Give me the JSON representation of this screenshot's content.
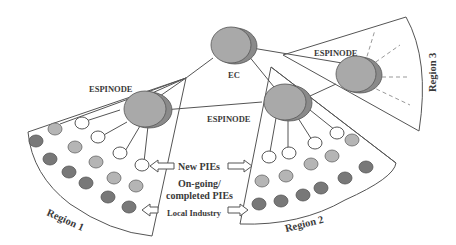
{
  "nodes": {
    "ec": {
      "label": "EC"
    },
    "espinode_1": {
      "label": "ESPINODE"
    },
    "espinode_2": {
      "label": "ESPINODE"
    },
    "espinode_3": {
      "label": "ESPINODE"
    }
  },
  "regions": {
    "region_1": {
      "label": "Region 1"
    },
    "region_2": {
      "label": "Region 2"
    },
    "region_3": {
      "label": "Region 3"
    }
  },
  "legend": {
    "new_pies": "New PIEs",
    "ongoing_line1": "On-going/",
    "ongoing_line2": "completed  PIEs",
    "local_industry": "Local Industry"
  },
  "colors": {
    "node_fill": "#a9a9a9",
    "new_pie_fill": "#ffffff",
    "ongoing_pie_fill": "#b5b5b5",
    "local_industry_fill": "#787878",
    "line": "#555555"
  }
}
